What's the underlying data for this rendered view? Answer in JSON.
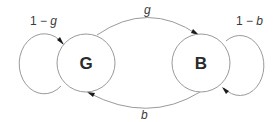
{
  "diagram": {
    "type": "state-transition",
    "nodes": [
      {
        "id": "G",
        "label": "G"
      },
      {
        "id": "B",
        "label": "B"
      }
    ],
    "edges": [
      {
        "from": "G",
        "to": "G",
        "label_prefix": "1 − ",
        "label_var": "g"
      },
      {
        "from": "G",
        "to": "B",
        "label_prefix": "",
        "label_var": "g"
      },
      {
        "from": "B",
        "to": "G",
        "label_prefix": "",
        "label_var": "b"
      },
      {
        "from": "B",
        "to": "B",
        "label_prefix": "1 − ",
        "label_var": "b"
      }
    ],
    "colors": {
      "stroke": "#9a9a9a",
      "arrowhead": "#1a1a1a",
      "node_text": "#2a2a2a",
      "edge_text": "#3a3a3a",
      "background": "#ffffff"
    }
  }
}
